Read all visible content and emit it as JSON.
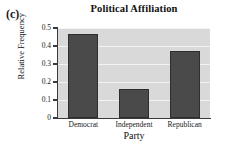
{
  "panel": {
    "label": "(c)"
  },
  "chart_data": {
    "type": "bar",
    "title": "Political Affiliation",
    "xlabel": "Party",
    "ylabel": "Relative Frequency",
    "categories": [
      "Democrat",
      "Independent",
      "Republican"
    ],
    "values": [
      0.465,
      0.16,
      0.375
    ],
    "ylim": [
      0,
      0.5
    ],
    "yticks": [
      0,
      0.1,
      0.2,
      0.3,
      0.4,
      0.5
    ],
    "ytick_labels": [
      "0",
      "0.1",
      "0.2",
      "0.3",
      "0.4",
      "0.5"
    ],
    "grid": true,
    "legend": "none",
    "bar_color": "#4a4a4a",
    "bar_edge_color": "#2e2e2e",
    "plot_background": "#d9d9d9",
    "gridline_color": "#f2f2f2",
    "axis_color": "#3a3a3a",
    "figure_background": "#ffffff"
  }
}
